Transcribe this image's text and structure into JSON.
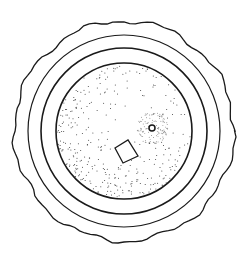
{
  "figure": {
    "background": "#ffffff",
    "ink": "#1a1a1a",
    "center": [
      124,
      131
    ],
    "outer_edge_radius": 110,
    "ring_outer_radius": 96,
    "ring_inner_radius": 83,
    "disk_radius": 68,
    "stipple_density": 900,
    "boss": {
      "x": 152,
      "y": 128,
      "r": 3
    },
    "boss_halo_radius": 16,
    "quad_marker": [
      [
        115,
        148
      ],
      [
        128,
        140
      ],
      [
        138,
        156
      ],
      [
        123,
        163
      ]
    ]
  }
}
